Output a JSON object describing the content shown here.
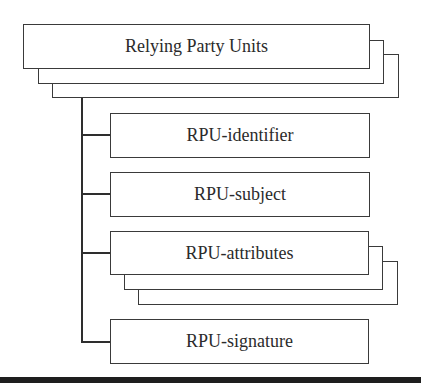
{
  "diagram": {
    "type": "tree",
    "root": {
      "label": "Relying Party Units",
      "multiple": true
    },
    "children": [
      {
        "label": "RPU-identifier",
        "multiple": false
      },
      {
        "label": "RPU-subject",
        "multiple": false
      },
      {
        "label": "RPU-attributes",
        "multiple": true
      },
      {
        "label": "RPU-signature",
        "multiple": false
      }
    ]
  },
  "colors": {
    "stroke": "#3a3a3a",
    "text": "#2b2b2b",
    "background": "#ffffff",
    "bottom_rule": "#1e1e1e"
  }
}
